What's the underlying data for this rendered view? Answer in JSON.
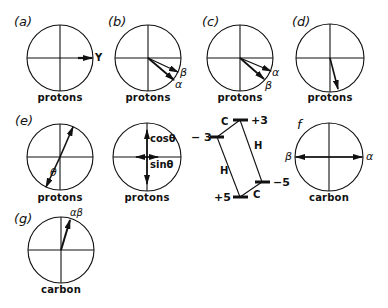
{
  "figure": {
    "panels": [
      {
        "id": "a",
        "label": "(a)",
        "caption": "protons",
        "vectors": [
          "Y"
        ]
      },
      {
        "id": "b",
        "label": "(b)",
        "caption": "protons",
        "vectors": [
          "β",
          "α"
        ]
      },
      {
        "id": "c",
        "label": "(c)",
        "caption": "protons",
        "vectors": [
          "α",
          "β"
        ]
      },
      {
        "id": "d",
        "label": "(d)",
        "caption": "protons",
        "vectors": []
      },
      {
        "id": "e",
        "label": "(e)",
        "caption": "protons",
        "angle": "θ"
      },
      {
        "id": "e2",
        "label": "",
        "caption": "protons",
        "components": [
          "cosθ",
          "sinθ"
        ]
      },
      {
        "id": "f",
        "label": "f",
        "caption": "carbon",
        "vectors": [
          "β",
          "α"
        ]
      },
      {
        "id": "g",
        "label": "(g)",
        "caption": "carbon",
        "vectors": [
          "αβ"
        ]
      }
    ],
    "energy_diagram": {
      "levels": [
        "+3",
        "-3",
        "-5",
        "+5"
      ],
      "transitions": [
        "C",
        "H",
        "H",
        "C"
      ]
    }
  },
  "text": {
    "a_label": "(a)",
    "b_label": "(b)",
    "c_label": "(c)",
    "d_label": "(d)",
    "e_label": "(e)",
    "f_label": "f",
    "g_label": "(g)",
    "protons": "protons",
    "carbon": "carbon",
    "Y": "Y",
    "alpha": "α",
    "beta": "β",
    "alphabeta": "αβ",
    "theta": "θ",
    "cos": "cosθ",
    "sin": "sinθ",
    "lev_p3": "+3",
    "lev_m3": "− 3",
    "lev_m5": "−5",
    "lev_p5": "+5",
    "C": "C",
    "H": "H"
  }
}
